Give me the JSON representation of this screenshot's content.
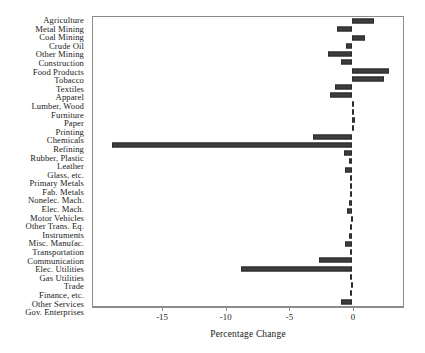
{
  "chart_data": {
    "type": "bar",
    "orientation": "horizontal",
    "title": "",
    "xlabel": "Percentage Change",
    "ylabel": "",
    "xlim": [
      -20.5,
      4.0
    ],
    "xticks": [
      -15,
      -10,
      -5,
      0
    ],
    "xticklabels": [
      "-15",
      "-10",
      "-5",
      "0"
    ],
    "grid": false,
    "legend": false,
    "bar_color": "#3d3d3d",
    "categories": [
      "Agriculture",
      "Metal Mining",
      "Coal Mining",
      "Crude Oil",
      "Other Mining",
      "Construction",
      "Food Products",
      "Tobacco",
      "Textiles",
      "Apparel",
      "Lumber, Wood",
      "Furniture",
      "Paper",
      "Printing",
      "Chemicals",
      "Refining",
      "Rubber, Plastic",
      "Leather",
      "Glass, etc.",
      "Primary Metals",
      "Fab. Metals",
      "Nonelec. Mach.",
      "Elec. Mach.",
      "Motor Vehicles",
      "Other Trans. Eq.",
      "Instruments",
      "Misc. Manufac.",
      "Transportation",
      "Communication",
      "Elec. Utilities",
      "Gas Utilities",
      "Trade",
      "Finance, etc.",
      "Other Services",
      "Gov. Enterprises"
    ],
    "values": [
      1.7,
      -1.2,
      1.0,
      -0.5,
      -1.9,
      -0.9,
      2.9,
      2.5,
      -1.4,
      -1.8,
      0.1,
      0.05,
      0.2,
      0.1,
      -3.1,
      -19.0,
      -0.7,
      -0.3,
      -0.6,
      -0.2,
      -0.15,
      -0.2,
      -0.3,
      -0.4,
      -0.1,
      -0.15,
      -0.3,
      -0.6,
      -0.2,
      -2.6,
      -8.8,
      -0.2,
      -0.1,
      -0.2,
      -0.9
    ]
  }
}
